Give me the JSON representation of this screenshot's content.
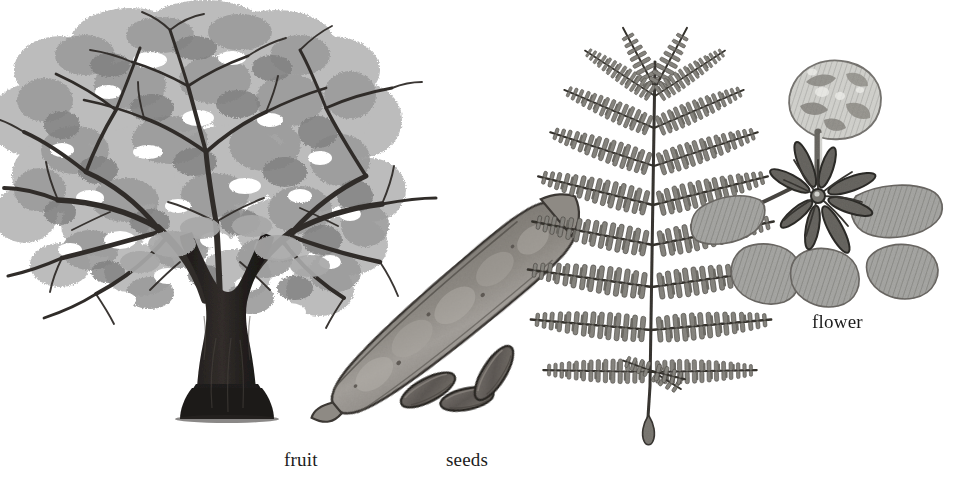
{
  "plate": {
    "kind": "botanical-illustration",
    "technique": "grayscale ink-and-wash",
    "background_color": "#ffffff",
    "width": 977,
    "height": 480
  },
  "palette": {
    "background": "#ffffff",
    "ink_dark": "#2a2a2a",
    "trunk_dark": "#231f1f",
    "branch_dark": "#3b3835",
    "foliage_mid": "#9c9c9c",
    "foliage_light": "#bcbcbc",
    "foliage_dark": "#7a7a7a",
    "pod_fill": "#9a9692",
    "pod_outline": "#403c39",
    "seed_fill": "#6f6a66",
    "seed_outline": "#2e2b28",
    "leaf_pinnule": "#87857f",
    "leaf_rachis": "#3a3733",
    "petal_mid": "#a3a3a0",
    "petal_light": "#cfcfcb",
    "stamen_dark": "#30302c",
    "label_text": "#1c1c1c"
  },
  "labels": [
    {
      "id": "fruit",
      "text": "fruit",
      "refers_to": "pod"
    },
    {
      "id": "seeds",
      "text": "seeds",
      "refers_to": "seeds"
    },
    {
      "id": "flower",
      "text": "flower",
      "refers_to": "flower"
    }
  ],
  "figures": [
    {
      "id": "tree",
      "name": "whole tree habit",
      "label": null,
      "description": "broad spreading umbrella-shaped canopy of soft grey foliage over a dark forked trunk"
    },
    {
      "id": "pod",
      "name": "fruit pod",
      "label": "fruit",
      "description": "long flat woody legume pod angled from lower-left to upper-right with a pointed beak"
    },
    {
      "id": "seeds",
      "name": "seeds",
      "label": "seeds",
      "count": 3,
      "description": "three elongated oblong mottled seeds set at differing angles"
    },
    {
      "id": "leaf",
      "name": "bipinnate compound leaf",
      "label": null,
      "pinnae_pairs": 9,
      "description": "feathery twice-pinnate leaf with a central rachis, opposite pinnae and many small oblong pinnules"
    },
    {
      "id": "flower",
      "name": "flower",
      "label": "flower",
      "petal_count": 5,
      "description": "five spreading crinkled petals, the uppermost standard petal paler and mottled, with dark arching stamens from the centre"
    }
  ]
}
